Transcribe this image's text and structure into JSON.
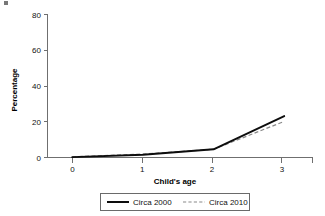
{
  "figure": {
    "name": "line-chart-figure",
    "background_color": "#ffffff",
    "ink_color": "#0d0d0d",
    "axis_color": "#6f6f6f",
    "secondary_series_color": "#8a8a8a",
    "artifact_note": "scan-speck"
  },
  "chart_data": {
    "type": "line",
    "title": "",
    "xlabel": "Child's age",
    "ylabel": "Percentage",
    "x": [
      0,
      1,
      2,
      3
    ],
    "xtick_labels": [
      "0",
      "1",
      "2",
      "3"
    ],
    "ytick_labels": [
      "0",
      "20",
      "40",
      "60",
      "80"
    ],
    "ytick_values": [
      0,
      20,
      40,
      60,
      80
    ],
    "xlim": [
      -0.35,
      3.4
    ],
    "ylim": [
      0,
      80
    ],
    "grid": false,
    "legend_position": "bottom-center",
    "legend_boxed": true,
    "series": [
      {
        "name": "Circa 2000",
        "style": "solid",
        "color": "#0d0d0d",
        "values": [
          0.2,
          1.5,
          4.6,
          23.2
        ]
      },
      {
        "name": "Circa 2010",
        "style": "dashed",
        "color": "#8a8a8a",
        "values": [
          0.4,
          1.9,
          4.6,
          20.2
        ]
      }
    ]
  }
}
